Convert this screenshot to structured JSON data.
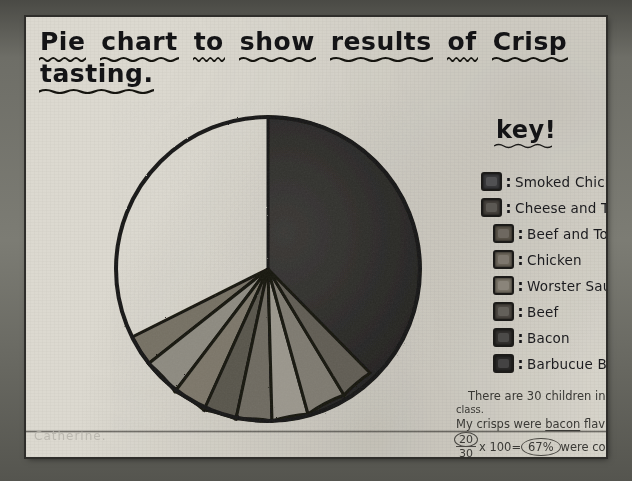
{
  "document": {
    "medium": "hand-drawn worksheet on paper (photograph)",
    "title_words": [
      "Pie",
      "chart",
      "to",
      "show",
      "results",
      "of",
      "Crisp"
    ],
    "title_line2": "tasting.",
    "signature": "Catherine."
  },
  "key": {
    "heading": "key!",
    "separator": ":",
    "items": [
      {
        "label": "Smoked Chicken",
        "swatch": "#3a3a3c",
        "indent": false
      },
      {
        "label": "Cheese and Tomatoe",
        "swatch": "#45413c",
        "indent": false
      },
      {
        "label": "Beef and Tomatoe",
        "swatch": "#5a544a",
        "indent": true
      },
      {
        "label": "Chicken",
        "swatch": "#6b655a",
        "indent": true
      },
      {
        "label": "Worster Saucse",
        "swatch": "#7a7468",
        "indent": true
      },
      {
        "label": "Beef",
        "swatch": "#4e4a44",
        "indent": true
      },
      {
        "label": "Bacon",
        "swatch": "#33312f",
        "indent": true
      },
      {
        "label": "Barbucue Beef",
        "swatch": "#2b2a29",
        "indent": true
      }
    ]
  },
  "notes": {
    "line1": "There are 30 children in our",
    "line2": "class.",
    "line3_pre": "My crisps were ",
    "line3_underlined": "bacon",
    "line3_post": " flaviour.",
    "numerator": "20",
    "denominator": "30",
    "times": "x 100=",
    "result": "67%",
    "after_result": "were   correct  so",
    "line5": "33% were  incorrect."
  },
  "chart_data": {
    "type": "pie",
    "title": "Pie chart to show results of Crisp tasting",
    "total": 30,
    "units": "children",
    "legend_position": "right",
    "note": "Most of the circle is one very large dark sector; seven thinner wedges fan across the lower portion.",
    "categories": [
      "Smoked Chicken",
      "Cheese and Tomatoe",
      "Beef and Tomatoe",
      "Chicken",
      "Worster Saucse",
      "Beef",
      "Bacon",
      "Barbucue Beef"
    ],
    "values": [
      1,
      1,
      1,
      1,
      1,
      1,
      1,
      23
    ],
    "percent": [
      3.3,
      3.3,
      3.3,
      3.3,
      3.3,
      3.3,
      3.3,
      76.7
    ],
    "colors": [
      "#3a3a3c",
      "#45413c",
      "#5a544a",
      "#6b655a",
      "#7a7468",
      "#4e4a44",
      "#33312f",
      "#2b2a29"
    ],
    "xlabel": "",
    "ylabel": ""
  }
}
